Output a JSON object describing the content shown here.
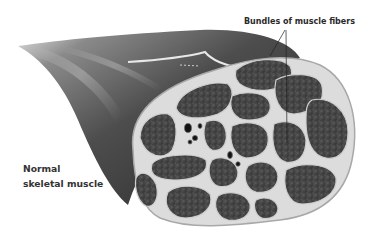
{
  "figure": {
    "labels": {
      "bundles": "Bundles of muscle fibers",
      "muscle_line1": "Normal",
      "muscle_line2": "skeletal muscle"
    },
    "colors": {
      "background": "#ffffff",
      "muscle_belly_dark": "#3c3c3c",
      "muscle_belly_light": "#9a9a9a",
      "fascicle_fill": "#4a4a4a",
      "perimysium": "#d9d9d9",
      "epimysium_outline": "#bdbdbd",
      "vessel": "#111111",
      "label_text": "#2a2a2a"
    }
  }
}
